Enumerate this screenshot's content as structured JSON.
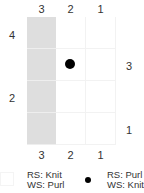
{
  "chart": {
    "columns_top": [
      "3",
      "2",
      "1"
    ],
    "columns_bottom": [
      "3",
      "2",
      "1"
    ],
    "rows_left": [
      "4",
      "2"
    ],
    "rows_right": [
      "3",
      "1"
    ],
    "grid": {
      "num_columns": 3,
      "num_rows": 4,
      "shaded_column_index": 0,
      "shaded_color": "#dedede",
      "dot_cell": {
        "row": 2,
        "column": 2
      }
    }
  },
  "legend": {
    "items": [
      {
        "symbol": "empty-square",
        "line1": "RS: Knit",
        "line2": "WS: Purl"
      },
      {
        "symbol": "dot",
        "line1": "RS: Purl",
        "line2": "WS: Knit"
      }
    ]
  }
}
